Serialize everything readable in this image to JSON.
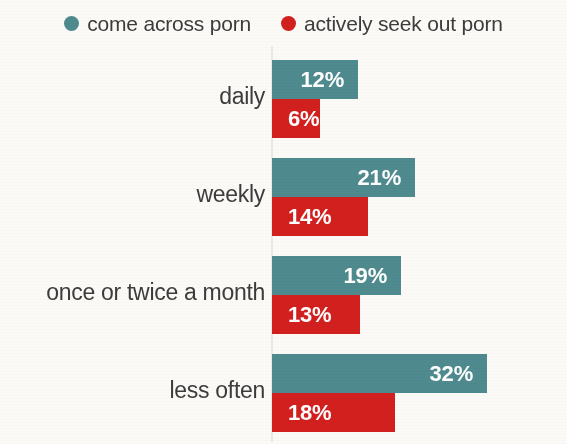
{
  "chart_data": {
    "type": "bar",
    "orientation": "horizontal",
    "title": "",
    "subtitle": "",
    "xlabel": "",
    "ylabel": "",
    "grid": false,
    "legend_position": "top-center",
    "axis_baseline_visible": true,
    "value_suffix": "%",
    "categories": [
      "daily",
      "weekly",
      "once or twice a month",
      "less often"
    ],
    "series": [
      {
        "name": "come across porn",
        "color": "#4e8a8e",
        "values": [
          12,
          21,
          19,
          32
        ],
        "labels": [
          "12%",
          "21%",
          "19%",
          "32%"
        ]
      },
      {
        "name": "actively seek out porn",
        "color": "#d2201f",
        "values": [
          6,
          14,
          13,
          18
        ],
        "labels": [
          "6%",
          "14%",
          "13%",
          "18%"
        ]
      }
    ],
    "xlim": [
      0,
      34
    ],
    "px_per_unit": 6.75,
    "bar_pixel_widths": {
      "come across porn": [
        86,
        143,
        129,
        215
      ],
      "actively seek out porn": [
        48,
        96,
        88,
        123
      ]
    }
  },
  "legend": {
    "items": [
      {
        "label": "come across porn",
        "color": "#4e8a8e",
        "marker": "circle-marker"
      },
      {
        "label": "actively seek out porn",
        "color": "#d2201f",
        "marker": "circle-marker"
      }
    ]
  },
  "colors": {
    "teal": "#4e8a8e",
    "red": "#d2201f",
    "background": "#fbfaf7",
    "text": "#3c3c3c",
    "axis": "#ece8e2",
    "value_text": "#ffffff"
  }
}
